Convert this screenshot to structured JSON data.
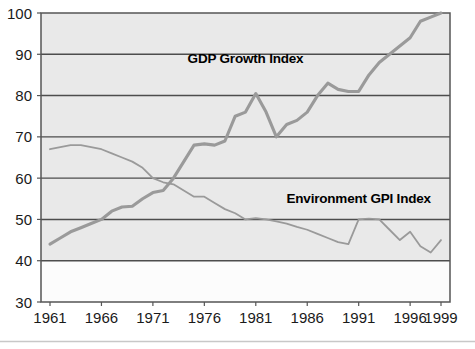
{
  "chart_data": {
    "type": "line",
    "title": "",
    "xlabel": "",
    "ylabel": "",
    "xlim": [
      1961,
      1999
    ],
    "ylim": [
      30,
      100
    ],
    "ytick_values": [
      100,
      90,
      80,
      70,
      60,
      50,
      40,
      30
    ],
    "ytick_labels": [
      "100",
      "90",
      "80",
      "70",
      "60",
      "50",
      "40",
      "30"
    ],
    "xtick_values": [
      1961,
      1966,
      1971,
      1976,
      1981,
      1986,
      1991,
      1996,
      1999
    ],
    "xtick_labels": [
      "1961",
      "1966",
      "1971",
      "1976",
      "1981",
      "1986",
      "1991",
      "1996",
      "1999"
    ],
    "grid": "horizontal",
    "legend_position": "inline-annotation",
    "band_shading": {
      "shaded_range": [
        40,
        100
      ],
      "shaded_color": "#e9e9e9",
      "plain_range": [
        30,
        40
      ],
      "plain_color": "#fcfcfc"
    },
    "colors": {
      "gdp_line": "#9a9a9a",
      "environment_line": "#9a9a9a",
      "gridline": "#4d4d4d",
      "frame": "#555555",
      "axis_text": "#1a1a1a",
      "label_text": "#000000"
    },
    "series": [
      {
        "name": "GDP Growth Index",
        "label": "GDP Growth Index",
        "label_x": 1980,
        "label_y": 88,
        "linewidth": 3.1,
        "x": [
          1961,
          1962,
          1963,
          1964,
          1965,
          1966,
          1967,
          1968,
          1969,
          1970,
          1971,
          1972,
          1973,
          1974,
          1975,
          1976,
          1977,
          1978,
          1979,
          1980,
          1981,
          1982,
          1983,
          1984,
          1985,
          1986,
          1987,
          1988,
          1989,
          1990,
          1991,
          1992,
          1993,
          1994,
          1995,
          1996,
          1997,
          1998,
          1999
        ],
        "values": [
          44,
          45.5,
          47,
          48,
          49,
          50,
          52,
          53,
          53.2,
          55,
          56.5,
          57,
          60,
          64,
          68,
          68.3,
          68,
          69,
          75,
          76,
          80.5,
          76,
          70,
          73,
          74,
          76,
          80,
          83,
          81.5,
          81,
          81,
          85,
          88,
          90,
          92,
          94,
          98,
          99,
          100
        ]
      },
      {
        "name": "Environment GPI Index",
        "label": "Environment GPI Index",
        "label_x": 1991,
        "label_y": 54,
        "linewidth": 1.8,
        "x": [
          1961,
          1962,
          1963,
          1964,
          1965,
          1966,
          1967,
          1968,
          1969,
          1970,
          1971,
          1972,
          1973,
          1974,
          1975,
          1976,
          1977,
          1978,
          1979,
          1980,
          1981,
          1982,
          1983,
          1984,
          1985,
          1986,
          1987,
          1988,
          1989,
          1990,
          1991,
          1992,
          1993,
          1994,
          1995,
          1996,
          1997,
          1998,
          1999
        ],
        "values": [
          67,
          67.5,
          68,
          68,
          67.5,
          67,
          66,
          65,
          64,
          62.5,
          60,
          59,
          58.5,
          57,
          55.5,
          55.5,
          54,
          52.5,
          51.5,
          50,
          50.3,
          50,
          49.5,
          49,
          48.2,
          47.5,
          46.5,
          45.5,
          44.5,
          44,
          50,
          50.2,
          50,
          47.5,
          45,
          47,
          43.5,
          42,
          45
        ]
      }
    ]
  },
  "plot_geometry": {
    "left": 41,
    "right": 450,
    "top": 13,
    "bottom": 302
  }
}
